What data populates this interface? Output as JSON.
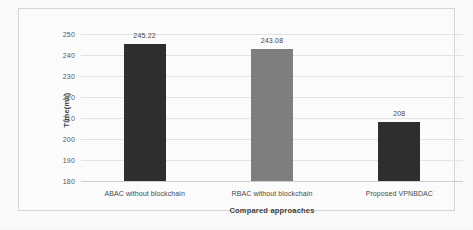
{
  "chart_data": {
    "type": "bar",
    "title": "",
    "subtitle": "",
    "xlabel": "Compared approaches",
    "ylabel": "Time(ms)",
    "categories": [
      "ABAC without blockchain",
      "RBAC without blockchain",
      "Proposed VPNBDAC"
    ],
    "values": [
      245.22,
      243.08,
      208
    ],
    "value_labels": [
      "245.22",
      "243.08",
      "208"
    ],
    "bar_colors": [
      "#2f2f2f",
      "#808080",
      "#2f2f2f"
    ],
    "ylim": [
      180,
      250
    ],
    "ytick_step": 10,
    "ytick_labels": [
      "180",
      "190",
      "200",
      "210",
      "220",
      "230",
      "240",
      "250"
    ],
    "ytick_values": [
      180,
      190,
      200,
      210,
      220,
      230,
      240,
      250
    ],
    "grid": true,
    "grid_axis": "y",
    "legend": false,
    "legend_position": "none"
  },
  "style": {
    "grid_color": "#e6e6e6",
    "axis_color": "#d0d0d0",
    "frame_color": "#d8d8d8",
    "text_color": "#4a4a4a",
    "title_color": "#3f3f3f",
    "background": "#ffffff"
  }
}
